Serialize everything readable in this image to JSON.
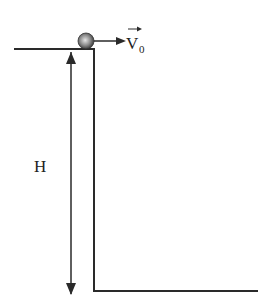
{
  "diagram": {
    "height_label": "H",
    "velocity_label": "V",
    "velocity_subscript": "0",
    "vector_arrow_symbol": "→",
    "colors": {
      "line": "#2a2a2a",
      "ball_light": "#d8d8d8",
      "ball_dark": "#3a3a3a"
    }
  }
}
